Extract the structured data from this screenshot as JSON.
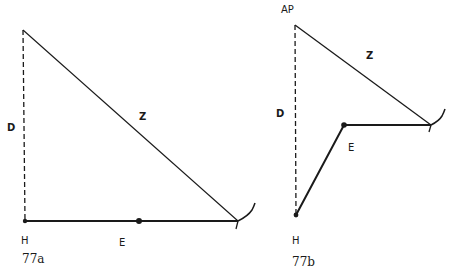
{
  "figures": [
    {
      "id": "77a",
      "caption": "77a",
      "labels": {
        "D": "D",
        "Z": "Z",
        "H": "H",
        "E": "E"
      },
      "description": "Right triangle: vertical dashed D, hypotenuse Z, horizontal baseline E from H to the hook; dot at midpoint of E"
    },
    {
      "id": "77b",
      "caption": "77b",
      "labels": {
        "AP": "AP",
        "D": "D",
        "Z": "Z",
        "H": "H",
        "E": "E"
      },
      "description": "Vertical dashed D from AP down to H, Z from AP to hook, E as a bent path from H up to elbow then horizontal to hook"
    }
  ],
  "colors": {
    "line": "#1a1a1a",
    "background": "#ffffff"
  }
}
